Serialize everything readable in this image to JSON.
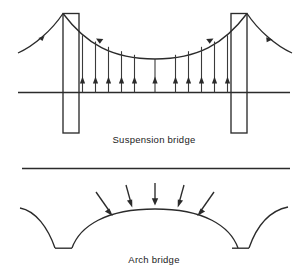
{
  "figure": {
    "background_color": "#ffffff",
    "line_color": "#2b2b2b",
    "width": 308,
    "height": 277
  },
  "panels": [
    {
      "id": "suspension",
      "caption": "Suspension bridge",
      "elements": {
        "tower_left": {
          "x": 63,
          "y": 13,
          "width": 16,
          "height": 120
        },
        "tower_right": {
          "x": 231,
          "y": 13,
          "width": 16,
          "height": 120
        },
        "deck_line": {
          "x1": 18,
          "y1": 92,
          "x2": 290,
          "y2": 92
        },
        "main_cable_sag_y": 59,
        "hanger_count": 11,
        "hanger_arrow_direction": "up",
        "side_cable_arrow_direction": "down-right",
        "main_cable_arrow_direction": "along-cable"
      }
    },
    {
      "id": "arch",
      "caption": "Arch bridge",
      "elements": {
        "deck_line": {
          "x1": 22,
          "y1": 168,
          "x2": 290,
          "y2": 168
        },
        "arch_crown": {
          "x": 155,
          "y": 209
        },
        "abutment_left": {
          "x1": 55,
          "y1": 248,
          "x2": 72,
          "y2": 248
        },
        "abutment_right": {
          "x1": 232,
          "y1": 248,
          "x2": 249,
          "y2": 248
        },
        "load_arrow_count": 5,
        "load_arrow_direction": "inward-toward-arch"
      }
    }
  ],
  "captions": {
    "suspension": "Suspension bridge",
    "arch": "Arch bridge"
  }
}
